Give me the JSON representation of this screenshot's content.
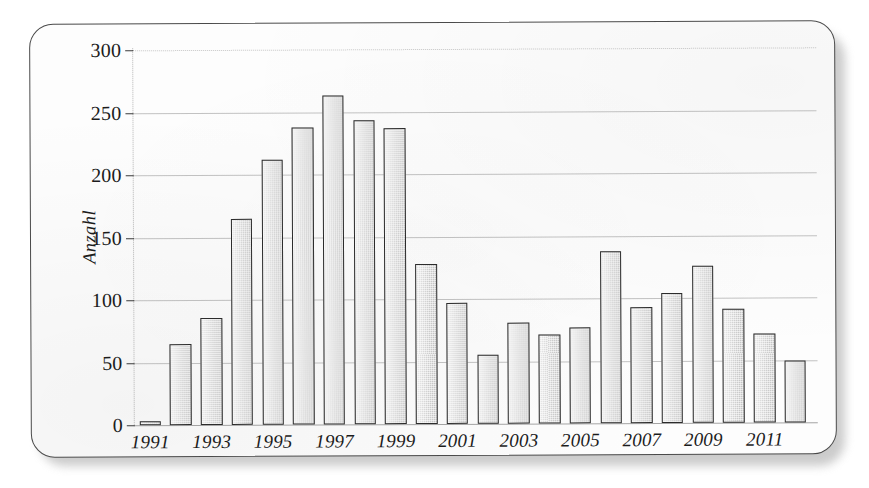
{
  "chart_data": {
    "type": "bar",
    "title": "",
    "subtitle": "",
    "xlabel": "",
    "ylabel": "Anzahl",
    "categories": [
      "1991",
      "1992",
      "1993",
      "1994",
      "1995",
      "1996",
      "1997",
      "1998",
      "1999",
      "2000",
      "2001",
      "2002",
      "2003",
      "2004",
      "2005",
      "2006",
      "2007",
      "2008",
      "2009",
      "2010",
      "2011",
      "2012"
    ],
    "values": [
      3,
      65,
      86,
      165,
      212,
      238,
      263,
      243,
      237,
      128,
      97,
      55,
      81,
      71,
      77,
      138,
      93,
      104,
      126,
      91,
      71,
      50
    ],
    "ylim": [
      0,
      300
    ],
    "yticks": [
      0,
      50,
      100,
      150,
      200,
      250,
      300
    ],
    "ytick_labels": [
      "0",
      "50",
      "100",
      "150",
      "200",
      "250",
      "300"
    ],
    "xtick_labels": [
      "1991",
      "1993",
      "1995",
      "1997",
      "1999",
      "2001",
      "2003",
      "2005",
      "2007",
      "2009",
      "2011"
    ],
    "xtick_categories": [
      "1991",
      "1993",
      "1995",
      "1997",
      "1999",
      "2001",
      "2003",
      "2005",
      "2007",
      "2009",
      "2011"
    ],
    "grid": true,
    "grid_axis": "y",
    "legend": null,
    "legend_position": "none",
    "annotations": [],
    "bar_fill_color": "#d8d8d8",
    "bar_edge_color": "#2c2c2c",
    "grid_color": "#9e9e9e",
    "text_color": "#1c1c1c",
    "background_color": "#fdfdfd"
  },
  "card": {
    "border_color": "#4a4a4a",
    "background_color": "#fdfdfd"
  }
}
